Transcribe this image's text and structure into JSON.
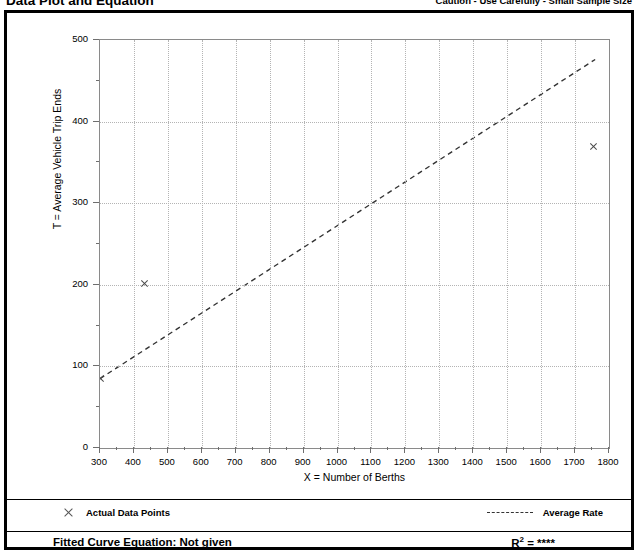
{
  "header": {
    "title": "Data Plot and Equation",
    "caution": "Caution - Use Carefully - Small Sample Size"
  },
  "legend": {
    "data_points_label": "Actual Data Points",
    "average_rate_label": "Average Rate"
  },
  "footer": {
    "fitted_equation": "Fitted Curve Equation:  Not given",
    "r_squared_prefix": "R",
    "r_squared_exponent": "2",
    "r_squared_value": "= ****"
  },
  "chart_data": {
    "type": "scatter",
    "title": "Data Plot and Equation",
    "xlabel": "X = Number of Berths",
    "ylabel": "T = Average Vehicle Trip Ends",
    "xlim": [
      300,
      1800
    ],
    "ylim": [
      0,
      500
    ],
    "xticks": [
      300,
      400,
      500,
      600,
      700,
      800,
      900,
      1000,
      1100,
      1200,
      1300,
      1400,
      1500,
      1600,
      1700,
      1800
    ],
    "yticks": [
      0,
      100,
      200,
      300,
      400,
      500
    ],
    "x_minor_tick_step": 50,
    "y_minor_tick_step": 50,
    "grid": true,
    "legend_position": "below-plot",
    "series": [
      {
        "name": "Actual Data Points",
        "type": "scatter",
        "marker": "x",
        "color": "#4a4a4a",
        "points": [
          {
            "x": 300,
            "y": 85
          },
          {
            "x": 430,
            "y": 201
          },
          {
            "x": 1755,
            "y": 370
          }
        ]
      },
      {
        "name": "Average Rate",
        "type": "line",
        "style": "dashed",
        "color": "#333333",
        "points": [
          {
            "x": 300,
            "y": 83
          },
          {
            "x": 1765,
            "y": 476
          }
        ]
      }
    ]
  }
}
